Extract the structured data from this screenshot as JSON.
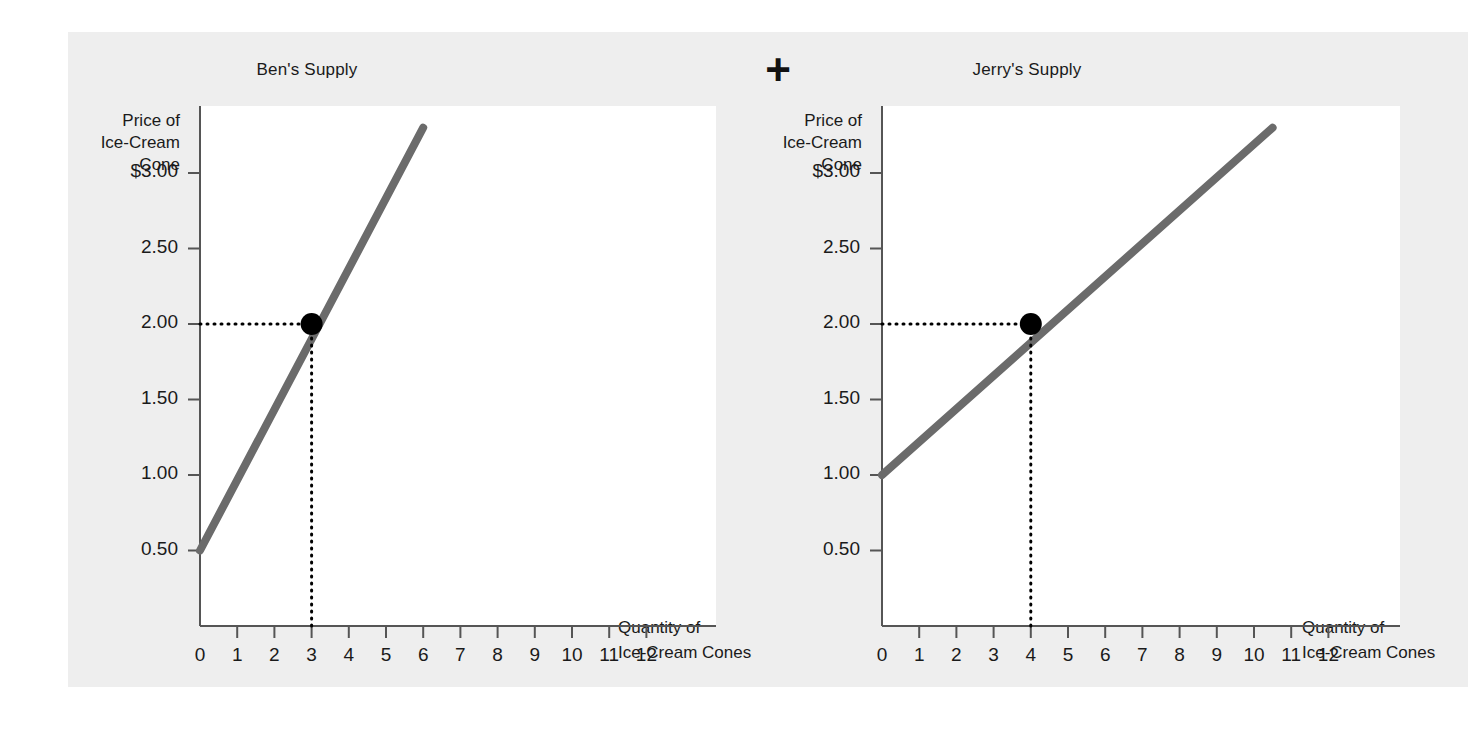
{
  "figure": {
    "background_color": "#eeeeee",
    "page_color": "#ffffff",
    "operator": "+",
    "operator_name": "plus-sign"
  },
  "charts": [
    {
      "id": "ben",
      "title": "Ben's Supply",
      "ylabel": "Price of\nIce-Cream\nCone",
      "xlabel": "Quantity of\nIce-Cream Cones",
      "curve_color": "#6b6b6b",
      "point_color": "#000000",
      "yticks": [
        "$3.00",
        "2.50",
        "2.00",
        "1.50",
        "1.00",
        "0.50"
      ],
      "ytick_values": [
        3.0,
        2.5,
        2.0,
        1.5,
        1.0,
        0.5
      ],
      "xticks": [
        "0",
        "1",
        "2",
        "3",
        "4",
        "5",
        "6",
        "7",
        "8",
        "9",
        "10",
        "11",
        "12"
      ],
      "xtick_values": [
        0,
        1,
        2,
        3,
        4,
        5,
        6,
        7,
        8,
        9,
        10,
        11,
        12
      ],
      "marked_point": {
        "quantity": 3,
        "price": 2.0
      }
    },
    {
      "id": "jerry",
      "title": "Jerry's Supply",
      "ylabel": "Price of\nIce-Cream\nCone",
      "xlabel": "Quantity of\nIce-Cream Cones",
      "curve_color": "#6b6b6b",
      "point_color": "#000000",
      "yticks": [
        "$3.00",
        "2.50",
        "2.00",
        "1.50",
        "1.00",
        "0.50"
      ],
      "ytick_values": [
        3.0,
        2.5,
        2.0,
        1.5,
        1.0,
        0.5
      ],
      "xticks": [
        "0",
        "1",
        "2",
        "3",
        "4",
        "5",
        "6",
        "7",
        "8",
        "9",
        "10",
        "11",
        "12"
      ],
      "xtick_values": [
        0,
        1,
        2,
        3,
        4,
        5,
        6,
        7,
        8,
        9,
        10,
        11,
        12
      ],
      "marked_point": {
        "quantity": 4,
        "price": 2.0
      }
    }
  ],
  "chart_data": [
    {
      "type": "line",
      "title": "Ben's Supply",
      "xlabel": "Quantity of Ice-Cream Cones",
      "ylabel": "Price of Ice-Cream Cone",
      "xlim": [
        0,
        13.2
      ],
      "ylim": [
        0,
        3.45
      ],
      "grid": false,
      "legend": "none",
      "series": [
        {
          "name": "Ben's supply curve",
          "color": "#6b6b6b",
          "x": [
            0,
            6
          ],
          "y": [
            0.5,
            3.3
          ]
        }
      ],
      "annotations": [
        {
          "type": "point",
          "label": "Ben's quantity supplied at $2.00",
          "x": 3,
          "y": 2.0,
          "marker": "filled-circle",
          "color": "#000000",
          "dotted_guides": [
            "horizontal-to-y-axis",
            "vertical-to-x-axis"
          ]
        }
      ],
      "xticks": [
        0,
        1,
        2,
        3,
        4,
        5,
        6,
        7,
        8,
        9,
        10,
        11,
        12
      ],
      "xticklabels": [
        "0",
        "1",
        "2",
        "3",
        "4",
        "5",
        "6",
        "7",
        "8",
        "9",
        "10",
        "11",
        "12"
      ],
      "yticks": [
        0.5,
        1.0,
        1.5,
        2.0,
        2.5,
        3.0
      ],
      "yticklabels": [
        "0.50",
        "1.00",
        "1.50",
        "2.00",
        "2.50",
        "$3.00"
      ]
    },
    {
      "type": "line",
      "title": "Jerry's Supply",
      "xlabel": "Quantity of Ice-Cream Cones",
      "ylabel": "Price of Ice-Cream Cone",
      "xlim": [
        0,
        13.2
      ],
      "ylim": [
        0,
        3.45
      ],
      "grid": false,
      "legend": "none",
      "series": [
        {
          "name": "Jerry's supply curve",
          "color": "#6b6b6b",
          "x": [
            0,
            10.5
          ],
          "y": [
            1.0,
            3.3
          ]
        }
      ],
      "annotations": [
        {
          "type": "point",
          "label": "Jerry's quantity supplied at $2.00",
          "x": 4,
          "y": 2.0,
          "marker": "filled-circle",
          "color": "#000000",
          "dotted_guides": [
            "horizontal-to-y-axis",
            "vertical-to-x-axis"
          ]
        }
      ],
      "xticks": [
        0,
        1,
        2,
        3,
        4,
        5,
        6,
        7,
        8,
        9,
        10,
        11,
        12
      ],
      "xticklabels": [
        "0",
        "1",
        "2",
        "3",
        "4",
        "5",
        "6",
        "7",
        "8",
        "9",
        "10",
        "11",
        "12"
      ],
      "yticks": [
        0.5,
        1.0,
        1.5,
        2.0,
        2.5,
        3.0
      ],
      "yticklabels": [
        "0.50",
        "1.00",
        "1.50",
        "2.00",
        "2.50",
        "$3.00"
      ]
    }
  ]
}
